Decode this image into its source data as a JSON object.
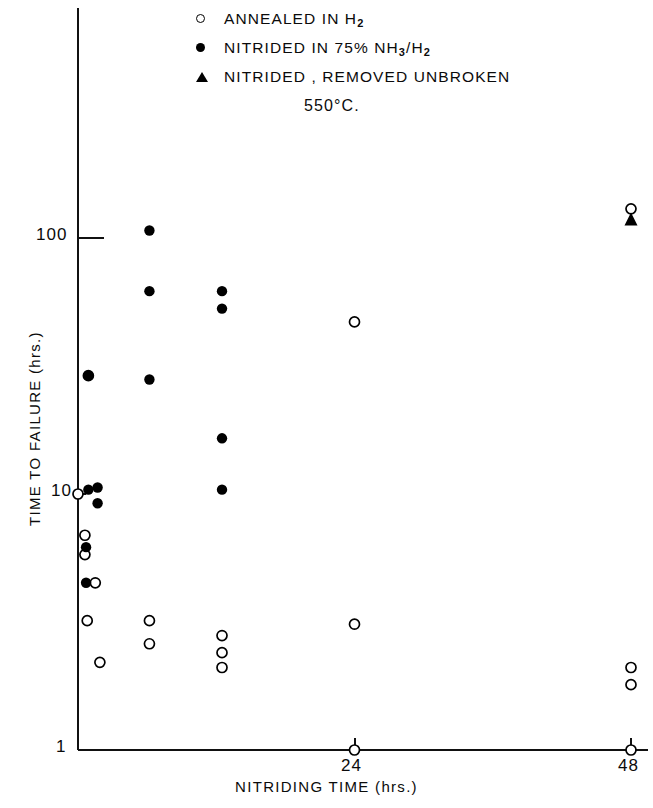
{
  "legend": {
    "items": [
      {
        "marker": "open-circle-icon",
        "label": "ANNEALED IN H",
        "sub": "2",
        "tail": ""
      },
      {
        "marker": "filled-circle-icon",
        "label": "NITRIDED IN 75% NH",
        "sub": "3",
        "tail": "/H",
        "sub2": "2"
      },
      {
        "marker": "filled-triangle-icon",
        "label": "NITRIDED , REMOVED UNBROKEN",
        "sub": "",
        "tail": ""
      }
    ],
    "temperature": "550°C."
  },
  "axes": {
    "x_title": "NITRIDING  TIME (hrs.)",
    "y_title": "TIME TO FAILURE (hrs.)",
    "x_ticks": [
      "24",
      "48"
    ],
    "y_ticks": [
      "100",
      "10",
      "1"
    ]
  },
  "chart_data": {
    "type": "scatter",
    "title": "",
    "subtitle": "550°C.",
    "xlabel": "NITRIDING TIME (hrs.)",
    "ylabel": "TIME TO FAILURE (hrs.)",
    "xlim": [
      0,
      51
    ],
    "ylim": [
      1,
      300
    ],
    "yscale": "log",
    "xscale": "linear",
    "grid": false,
    "legend_position": "top-center",
    "series": [
      {
        "name": "ANNEALED IN H2",
        "marker": "open-circle",
        "points": [
          {
            "x": 0.9,
            "y": 29.0
          },
          {
            "x": 0.0,
            "y": 10.0
          },
          {
            "x": 0.6,
            "y": 6.9
          },
          {
            "x": 0.6,
            "y": 5.8
          },
          {
            "x": 1.5,
            "y": 4.5
          },
          {
            "x": 0.8,
            "y": 3.2
          },
          {
            "x": 1.9,
            "y": 2.2
          },
          {
            "x": 6.2,
            "y": 3.2
          },
          {
            "x": 6.2,
            "y": 2.6
          },
          {
            "x": 12.5,
            "y": 2.8
          },
          {
            "x": 12.5,
            "y": 2.4
          },
          {
            "x": 12.5,
            "y": 2.1
          },
          {
            "x": 24.0,
            "y": 47.0
          },
          {
            "x": 24.0,
            "y": 3.1
          },
          {
            "x": 24.0,
            "y": 1.0
          },
          {
            "x": 48.0,
            "y": 130.0
          },
          {
            "x": 48.0,
            "y": 2.1
          },
          {
            "x": 48.0,
            "y": 1.8
          },
          {
            "x": 48.0,
            "y": 1.0
          }
        ]
      },
      {
        "name": "NITRIDED IN 75% NH3/H2",
        "marker": "filled-circle",
        "points": [
          {
            "x": 0.9,
            "y": 29.0
          },
          {
            "x": 0.9,
            "y": 10.4
          },
          {
            "x": 1.7,
            "y": 10.6
          },
          {
            "x": 1.7,
            "y": 9.2
          },
          {
            "x": 0.7,
            "y": 6.2
          },
          {
            "x": 0.7,
            "y": 4.5
          },
          {
            "x": 6.2,
            "y": 107.0
          },
          {
            "x": 6.2,
            "y": 62.0
          },
          {
            "x": 6.2,
            "y": 28.0
          },
          {
            "x": 12.5,
            "y": 62.0
          },
          {
            "x": 12.5,
            "y": 53.0
          },
          {
            "x": 12.5,
            "y": 16.5
          },
          {
            "x": 12.5,
            "y": 10.4
          }
        ]
      },
      {
        "name": "NITRIDED, REMOVED UNBROKEN",
        "marker": "filled-triangle",
        "points": [
          {
            "x": 48.0,
            "y": 118.0
          }
        ]
      }
    ]
  }
}
